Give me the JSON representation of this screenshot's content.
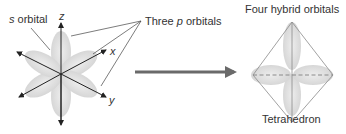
{
  "left": {
    "s_label_prefix": "s",
    "s_label_suffix": " orbital",
    "axis_z": "z",
    "axis_x": "x",
    "axis_y": "y",
    "p_label_prefix": "Three ",
    "p_label_italic": "p",
    "p_label_suffix": " orbitals"
  },
  "right": {
    "title": "Four hybrid orbitals",
    "shape_label": "Tetrahedron"
  },
  "colors": {
    "lobe": "#dcdcdc",
    "axis": "#222222",
    "arrow": "#6a6a6a",
    "edge": "#8a8a8a"
  }
}
